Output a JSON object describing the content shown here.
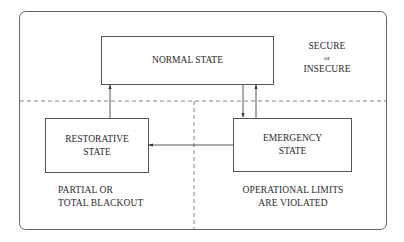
{
  "diagram": {
    "states": {
      "normal": {
        "label": "NORMAL STATE"
      },
      "restorative": {
        "line1": "RESTORATIVE",
        "line2": "STATE"
      },
      "emergency": {
        "line1": "EMERGENCY",
        "line2": "STATE"
      }
    },
    "annotations": {
      "normal": {
        "line1": "SECURE",
        "line2": "or",
        "line3": "INSECURE"
      },
      "restorative": {
        "line1": "PARTIAL OR",
        "line2": "TOTAL BLACKOUT"
      },
      "emergency": {
        "line1": "OPERATIONAL LIMITS",
        "line2": "ARE VIOLATED"
      }
    },
    "transitions": [
      {
        "from": "restorative",
        "to": "normal"
      },
      {
        "from": "normal",
        "to": "emergency"
      },
      {
        "from": "emergency",
        "to": "normal"
      },
      {
        "from": "emergency",
        "to": "restorative"
      }
    ],
    "colors": {
      "line": "#555555",
      "dashed": "#666666",
      "text": "#2b2b2b",
      "background": "#ffffff"
    }
  }
}
